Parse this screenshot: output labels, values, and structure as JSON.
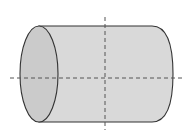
{
  "diagram": {
    "type": "cylinder",
    "orientation": "horizontal",
    "colors": {
      "body_fill": "#d9d9d9",
      "end_face_fill": "#cbcbcb",
      "outline": "#333333",
      "axis_line": "#555555",
      "background": "#ffffff"
    },
    "geometry": {
      "top_y": 26,
      "bottom_y": 122,
      "left_ellipse_cx": 39,
      "left_ellipse_rx": 19,
      "right_body_x": 152,
      "right_curve_extent_x": 173,
      "center_y": 78,
      "vertical_axis_x": 105
    },
    "axes": [
      {
        "name": "horizontal-axis",
        "x1": 10,
        "y1": 78,
        "x2": 185,
        "y2": 78,
        "style": "dashed"
      },
      {
        "name": "vertical-axis",
        "x1": 105,
        "y1": 17,
        "x2": 105,
        "y2": 130,
        "style": "dashed"
      }
    ]
  }
}
